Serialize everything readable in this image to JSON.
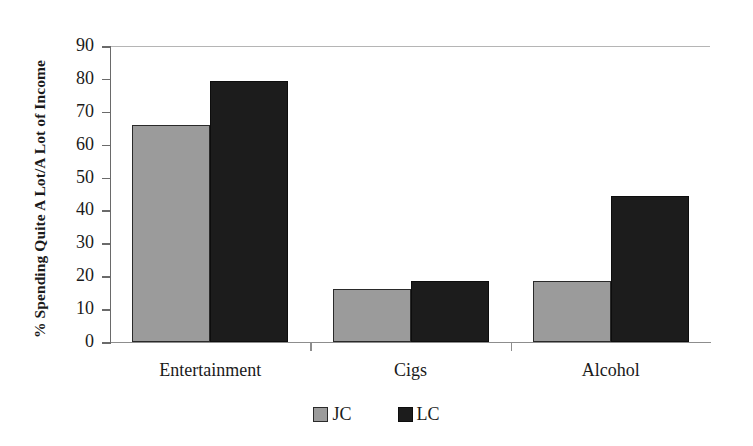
{
  "chart_data": {
    "type": "bar",
    "title": "",
    "subtitle": "",
    "xlabel": "",
    "ylabel": "% Spending Quite A Lot/A Lot of Income",
    "categories": [
      "Entertainment",
      "Cigs",
      "Alcohol"
    ],
    "series": [
      {
        "name": "JC",
        "color": "#9b9b9b",
        "values": [
          66,
          16,
          18.5
        ]
      },
      {
        "name": "LC",
        "color": "#1c1c1c",
        "values": [
          79.5,
          18.5,
          44.5
        ]
      }
    ],
    "ylim": [
      0,
      90
    ],
    "ytick_step": 10,
    "ytick_labels": [
      "90",
      "80",
      "70",
      "60",
      "50",
      "40",
      "30",
      "20",
      "10",
      "0"
    ],
    "grid": false,
    "legend_position": "bottom-center",
    "annotations": []
  },
  "legend": {
    "items": [
      {
        "label": "JC",
        "swatch": "legend-swatch-jc"
      },
      {
        "label": "LC",
        "swatch": "legend-swatch-lc"
      }
    ]
  },
  "colors": {
    "jc_fill": "#9b9b9b",
    "lc_fill": "#1c1c1c",
    "bar_outline": "#2a2a2a",
    "axis": "#6a6a6a",
    "text": "#1a1a1a",
    "background": "#ffffff"
  }
}
